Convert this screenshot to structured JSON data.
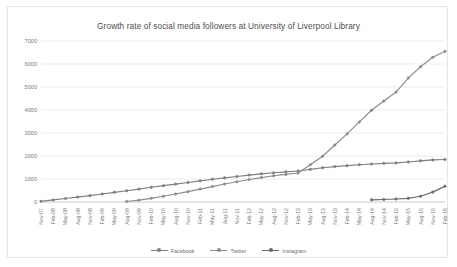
{
  "chart_data": {
    "type": "line",
    "title": "Growth rate of social media followers at University of Liverpool Library",
    "xlabel": "",
    "ylabel": "",
    "ylim": [
      0,
      7000
    ],
    "ytick_labels": [
      "0",
      "1000",
      "2000",
      "3000",
      "4000",
      "5000",
      "6000",
      "7000"
    ],
    "ytick_values": [
      0,
      1000,
      2000,
      3000,
      4000,
      5000,
      6000,
      7000
    ],
    "grid": true,
    "legend_position": "bottom",
    "categories": [
      "Nov-07",
      "Feb-08",
      "May-08",
      "Aug-08",
      "Nov-08",
      "Feb-09",
      "May-09",
      "Aug-09",
      "Nov-09",
      "Feb-10",
      "May-10",
      "Aug-10",
      "Nov-10",
      "Feb-11",
      "May-11",
      "Aug-11",
      "Nov-11",
      "Feb-12",
      "May-12",
      "Aug-12",
      "Nov-12",
      "Feb-13",
      "May-13",
      "Aug-13",
      "Nov-13",
      "Feb-14",
      "May-14",
      "Aug-14",
      "Nov-14",
      "Feb-15",
      "May-15",
      "Aug-15",
      "Nov-15",
      "Feb-16"
    ],
    "series": [
      {
        "name": "Facebook",
        "color": "#7f7f7f",
        "values": [
          30,
          90,
          150,
          215,
          280,
          350,
          420,
          490,
          560,
          640,
          710,
          780,
          850,
          920,
          990,
          1050,
          1110,
          1170,
          1225,
          1270,
          1310,
          1350,
          1420,
          1490,
          1540,
          1580,
          1620,
          1650,
          1680,
          1700,
          1740,
          1790,
          1830,
          1850
        ]
      },
      {
        "name": "Twitter",
        "color": "#8c8c8c",
        "values": [
          null,
          null,
          null,
          null,
          null,
          null,
          null,
          20,
          80,
          160,
          250,
          350,
          450,
          560,
          670,
          780,
          880,
          980,
          1060,
          1140,
          1200,
          1260,
          1620,
          1990,
          2480,
          2960,
          3480,
          3990,
          4390,
          4780,
          5390,
          5880,
          6290,
          6550
        ]
      },
      {
        "name": "Instagram",
        "color": "#6b6b6b",
        "values": [
          null,
          null,
          null,
          null,
          null,
          null,
          null,
          null,
          null,
          null,
          null,
          null,
          null,
          null,
          null,
          null,
          null,
          null,
          null,
          null,
          null,
          null,
          null,
          null,
          null,
          null,
          null,
          95,
          110,
          130,
          160,
          250,
          430,
          690
        ]
      }
    ]
  },
  "legend": {
    "items": [
      {
        "label": "Facebook"
      },
      {
        "label": "Twitter"
      },
      {
        "label": "Instagram"
      }
    ]
  }
}
